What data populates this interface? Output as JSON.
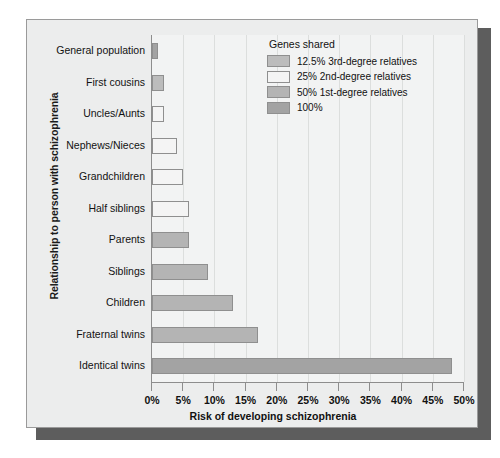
{
  "chart_data": {
    "type": "bar",
    "orientation": "horizontal",
    "title": "",
    "xlabel": "Risk of developing schizophrenia",
    "ylabel": "Relationship to person with schizophrenia",
    "xlim": [
      0,
      50
    ],
    "xticks": [
      "0%",
      "5%",
      "10%",
      "15%",
      "20%",
      "25%",
      "30%",
      "35%",
      "40%",
      "45%",
      "50%"
    ],
    "xtick_values": [
      0,
      5,
      10,
      15,
      20,
      25,
      30,
      35,
      40,
      45,
      50
    ],
    "grid": true,
    "legend_position": "top-right",
    "categories": [
      "General population",
      "First cousins",
      "Uncles/Aunts",
      "Nephews/Nieces",
      "Grandchildren",
      "Half siblings",
      "Parents",
      "Siblings",
      "Children",
      "Fraternal twins",
      "Identical twins"
    ],
    "values": [
      1,
      2,
      2,
      4,
      5,
      6,
      6,
      9,
      13,
      17,
      48
    ],
    "group_of_bar": [
      3,
      0,
      1,
      1,
      1,
      1,
      2,
      2,
      2,
      2,
      3
    ],
    "legend": {
      "title": "Genes shared",
      "entries": [
        {
          "label": "12.5% 3rd-degree relatives",
          "color": "#bcbcbc"
        },
        {
          "label": "25% 2nd-degree relatives",
          "color": "#f4f4f4"
        },
        {
          "label": "50% 1st-degree relatives",
          "color": "#b4b4b4"
        },
        {
          "label": "100%",
          "color": "#a3a3a3"
        }
      ]
    }
  }
}
